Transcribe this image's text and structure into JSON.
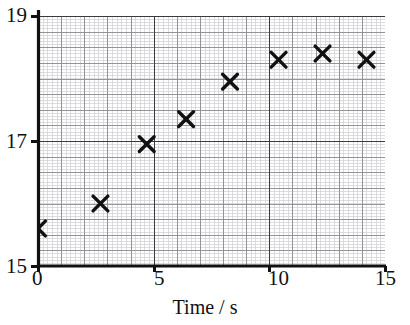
{
  "chart_data": {
    "type": "scatter",
    "title": "",
    "xlabel": "Time / s",
    "ylabel": "",
    "xlim": [
      0,
      15
    ],
    "ylim": [
      15,
      19
    ],
    "xticks": [
      "0",
      "5",
      "10",
      "15"
    ],
    "xtick_values": [
      0,
      5,
      10,
      15
    ],
    "yticks": [
      "19",
      "17",
      "15"
    ],
    "ytick_values": [
      19,
      17,
      15
    ],
    "grid": true,
    "grid_major_x_step": 1,
    "grid_major_y_step": 0.25,
    "grid_minor_x_step": 0.2,
    "grid_minor_y_step": 0.05,
    "legend": null,
    "marker": "x-cross",
    "marker_color": "#111111",
    "series": [
      {
        "name": "measurements",
        "points": [
          {
            "x": 0.0,
            "y": 15.6
          },
          {
            "x": 2.7,
            "y": 16.0
          },
          {
            "x": 4.7,
            "y": 16.95
          },
          {
            "x": 6.4,
            "y": 17.35
          },
          {
            "x": 8.3,
            "y": 17.95
          },
          {
            "x": 10.4,
            "y": 18.3
          },
          {
            "x": 12.3,
            "y": 18.4
          },
          {
            "x": 14.2,
            "y": 18.3
          }
        ]
      }
    ]
  },
  "axes": {
    "x_title": "Time / s",
    "x_tick_0": "0",
    "x_tick_1": "5",
    "x_tick_2": "10",
    "x_tick_3": "15",
    "y_tick_top": "19",
    "y_tick_mid": "17",
    "y_tick_bottom": "15"
  },
  "colors": {
    "axis": "#111111",
    "grid_major": "#8c8c90",
    "grid_minor": "#cfcfd4",
    "emphasis_line": "#3b3b3f",
    "marker": "#111111",
    "background": "#ffffff"
  }
}
